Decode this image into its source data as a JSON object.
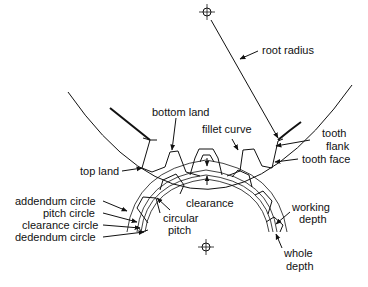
{
  "diagram": {
    "labels": {
      "root_radius": "root radius",
      "bottom_land": "bottom land",
      "fillet_curve": "fillet curve",
      "tooth_flank_1": "tooth",
      "tooth_flank_2": "flank",
      "tooth_face": "tooth face",
      "top_land": "top land",
      "addendum_circle": "addendum circle",
      "pitch_circle": "pitch circle",
      "clearance_circle": "clearance circle",
      "dedendum_circle": "dedendum circle",
      "clearance": "clearance",
      "circular_pitch_1": "circular",
      "circular_pitch_2": "pitch",
      "working_depth_1": "working",
      "working_depth_2": "depth",
      "whole_depth_1": "whole",
      "whole_depth_2": "depth"
    }
  }
}
